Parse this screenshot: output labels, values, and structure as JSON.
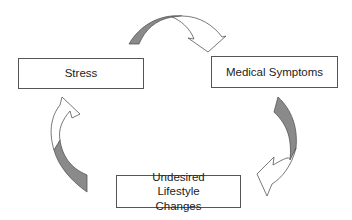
{
  "diagram": {
    "type": "cycle",
    "nodes": [
      {
        "id": "stress",
        "label": "Stress"
      },
      {
        "id": "medical",
        "label": "Medical Symptoms"
      },
      {
        "id": "lifestyle",
        "label": "Undesired Lifestyle Changes"
      }
    ],
    "edges": [
      {
        "from": "stress",
        "to": "medical"
      },
      {
        "from": "medical",
        "to": "lifestyle"
      },
      {
        "from": "lifestyle",
        "to": "stress"
      }
    ],
    "colors": {
      "arrow_dark": "#8a8a8a",
      "outline": "#555555"
    }
  }
}
